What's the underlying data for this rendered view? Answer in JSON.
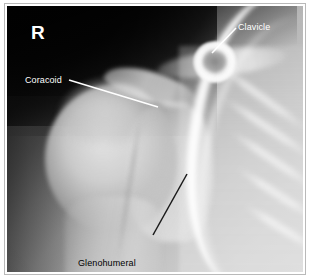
{
  "figure": {
    "modality": "radiograph",
    "view": "shoulder-ap",
    "side_marker": "R",
    "border_color": "#b9b9b9",
    "paper_color": "#ffffff"
  },
  "annotations": [
    {
      "id": "clavicle",
      "label": "Clavicle",
      "text_color": "#ffffff",
      "leader_color": "#ffffff",
      "leader": {
        "x1": 229,
        "y1": 22,
        "x2": 205,
        "y2": 47
      }
    },
    {
      "id": "coracoid",
      "label": "Coracoid",
      "text_color": "#ffffff",
      "leader_color": "#ffffff",
      "leader": {
        "x1": 62,
        "y1": 74,
        "x2": 151,
        "y2": 101
      }
    },
    {
      "id": "glenohumeral-joint",
      "label_line_1": "Glenohumeral",
      "label_line_2": "joint",
      "text_color": "#000000",
      "leader_color": "#1a1a1a",
      "leader": {
        "x1": 146,
        "y1": 229,
        "x2": 180,
        "y2": 168
      }
    }
  ]
}
